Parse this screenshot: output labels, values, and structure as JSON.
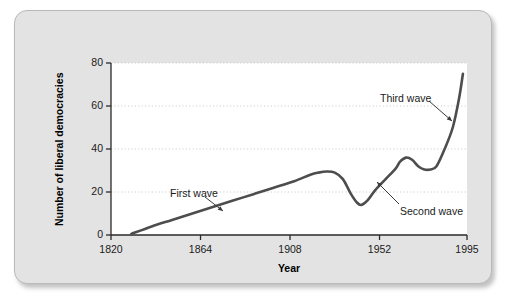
{
  "chart_data": {
    "type": "line",
    "title": "",
    "xlabel": "Year",
    "ylabel": "Number of liberal democracies",
    "xlim": [
      1820,
      1995
    ],
    "ylim": [
      0,
      80
    ],
    "grid": true,
    "legend": false,
    "xticks": [
      "1820",
      "1864",
      "1908",
      "1952",
      "1995"
    ],
    "xtick_values": [
      1820,
      1864,
      1908,
      1952,
      1995
    ],
    "yticks": [
      "0",
      "20",
      "40",
      "60",
      "80"
    ],
    "ytick_values": [
      0,
      20,
      40,
      60,
      80
    ],
    "line_color": "#4d4d4d",
    "plot_background": "#ffffff",
    "series": [
      {
        "name": "Number of liberal democracies",
        "x": [
          1830,
          1840,
          1850,
          1860,
          1870,
          1880,
          1890,
          1900,
          1910,
          1918,
          1922,
          1926,
          1930,
          1934,
          1938,
          1941,
          1943,
          1946,
          1950,
          1955,
          1960,
          1962,
          1965,
          1968,
          1971,
          1974,
          1977,
          1980,
          1984,
          1988,
          1991,
          1993
        ],
        "y": [
          0.5,
          4,
          7,
          10,
          13,
          16,
          19,
          22,
          25,
          28,
          29,
          29.5,
          29,
          26,
          19,
          15,
          14,
          16,
          21,
          26,
          31,
          34,
          36,
          35,
          32,
          30.5,
          30.5,
          32,
          40,
          50,
          63,
          75
        ]
      }
    ],
    "annotations": [
      {
        "label": "First wave",
        "text_x": 155,
        "text_y": 176,
        "line_x1": 190,
        "line_y1": 186,
        "line_x2": 208,
        "line_y2": 200
      },
      {
        "label": "Second wave",
        "text_x": 385,
        "text_y": 194,
        "line_x1": 384,
        "line_y1": 193,
        "line_x2": 362,
        "line_y2": 171
      },
      {
        "label": "Third wave",
        "text_x": 365,
        "text_y": 81,
        "line_x1": 414,
        "line_y1": 90,
        "line_x2": 437,
        "line_y2": 110
      }
    ]
  }
}
